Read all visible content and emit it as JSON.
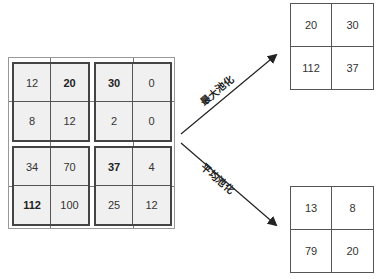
{
  "input": {
    "quadrants": [
      {
        "cells": [
          "12",
          "20",
          "8",
          "12"
        ],
        "bold": [
          1
        ]
      },
      {
        "cells": [
          "30",
          "0",
          "2",
          "0"
        ],
        "bold": [
          0
        ]
      },
      {
        "cells": [
          "34",
          "70",
          "112",
          "100"
        ],
        "bold": [
          2
        ]
      },
      {
        "cells": [
          "37",
          "4",
          "25",
          "12"
        ],
        "bold": [
          0
        ]
      }
    ]
  },
  "max_pool": {
    "label": "最大池化",
    "cells": [
      "20",
      "30",
      "112",
      "37"
    ]
  },
  "avg_pool": {
    "label": "平均池化",
    "cells": [
      "13",
      "8",
      "79",
      "20"
    ]
  },
  "colors": {
    "cell_fill": "#f0f0f0",
    "border": "#444444",
    "arrow": "#222222"
  }
}
